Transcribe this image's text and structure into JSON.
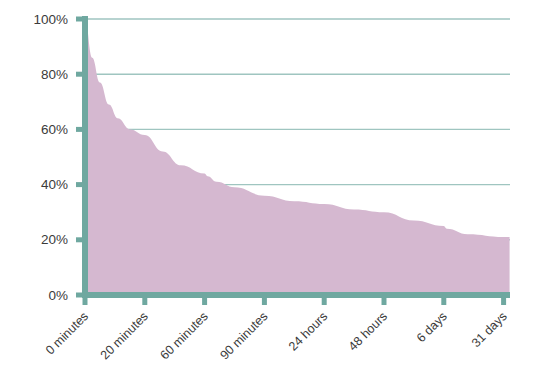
{
  "chart_data": {
    "type": "area",
    "title": "",
    "subtitle": "",
    "xlabel": "",
    "ylabel": "",
    "categories": [
      "0 minutes",
      "20 minutes",
      "60 minutes",
      "90 minutes",
      "24 hours",
      "48 hours",
      "6 days",
      "31 days"
    ],
    "x": [
      0,
      1,
      2,
      3,
      4,
      5,
      6,
      7
    ],
    "values": [
      100,
      58,
      44,
      36,
      33,
      30,
      25,
      21
    ],
    "series": [
      {
        "name": "Retention",
        "values": [
          100,
          58,
          44,
          36,
          33,
          30,
          25,
          21
        ]
      }
    ],
    "curve_points": [
      {
        "x": 0.0,
        "y": 100
      },
      {
        "x": 0.12,
        "y": 86
      },
      {
        "x": 0.25,
        "y": 77
      },
      {
        "x": 0.4,
        "y": 69
      },
      {
        "x": 0.55,
        "y": 64
      },
      {
        "x": 0.75,
        "y": 60
      },
      {
        "x": 1.0,
        "y": 58
      },
      {
        "x": 1.3,
        "y": 52
      },
      {
        "x": 1.6,
        "y": 47
      },
      {
        "x": 2.0,
        "y": 44
      },
      {
        "x": 2.05,
        "y": 43
      },
      {
        "x": 2.2,
        "y": 41
      },
      {
        "x": 2.5,
        "y": 39
      },
      {
        "x": 3.0,
        "y": 36
      },
      {
        "x": 3.5,
        "y": 34
      },
      {
        "x": 4.0,
        "y": 33
      },
      {
        "x": 4.5,
        "y": 31
      },
      {
        "x": 5.0,
        "y": 30
      },
      {
        "x": 5.5,
        "y": 27
      },
      {
        "x": 6.0,
        "y": 25
      },
      {
        "x": 6.05,
        "y": 24
      },
      {
        "x": 6.4,
        "y": 22
      },
      {
        "x": 7.0,
        "y": 21
      },
      {
        "x": 7.1,
        "y": 21
      }
    ],
    "ylim": [
      0,
      100
    ],
    "ytick_values": [
      0,
      20,
      40,
      60,
      80,
      100
    ],
    "ytick_labels": [
      "0%",
      "20%",
      "40%",
      "60%",
      "80%",
      "100%"
    ],
    "xtick_labels": [
      "0 minutes",
      "20 minutes",
      "60 minutes",
      "90 minutes",
      "24 hours",
      "48 hours",
      "6 days",
      "31 days"
    ],
    "grid": true,
    "grid_axis": "y",
    "legend": false,
    "legend_position": "none",
    "annotations": []
  },
  "style": {
    "area_fill": "#d5b8d0",
    "axis_color": "#6fa8a0",
    "grid_color": "#9fc5c0",
    "text_color": "#3b3b3b",
    "background": "#ffffff",
    "xtick_rotation_deg": -45
  }
}
